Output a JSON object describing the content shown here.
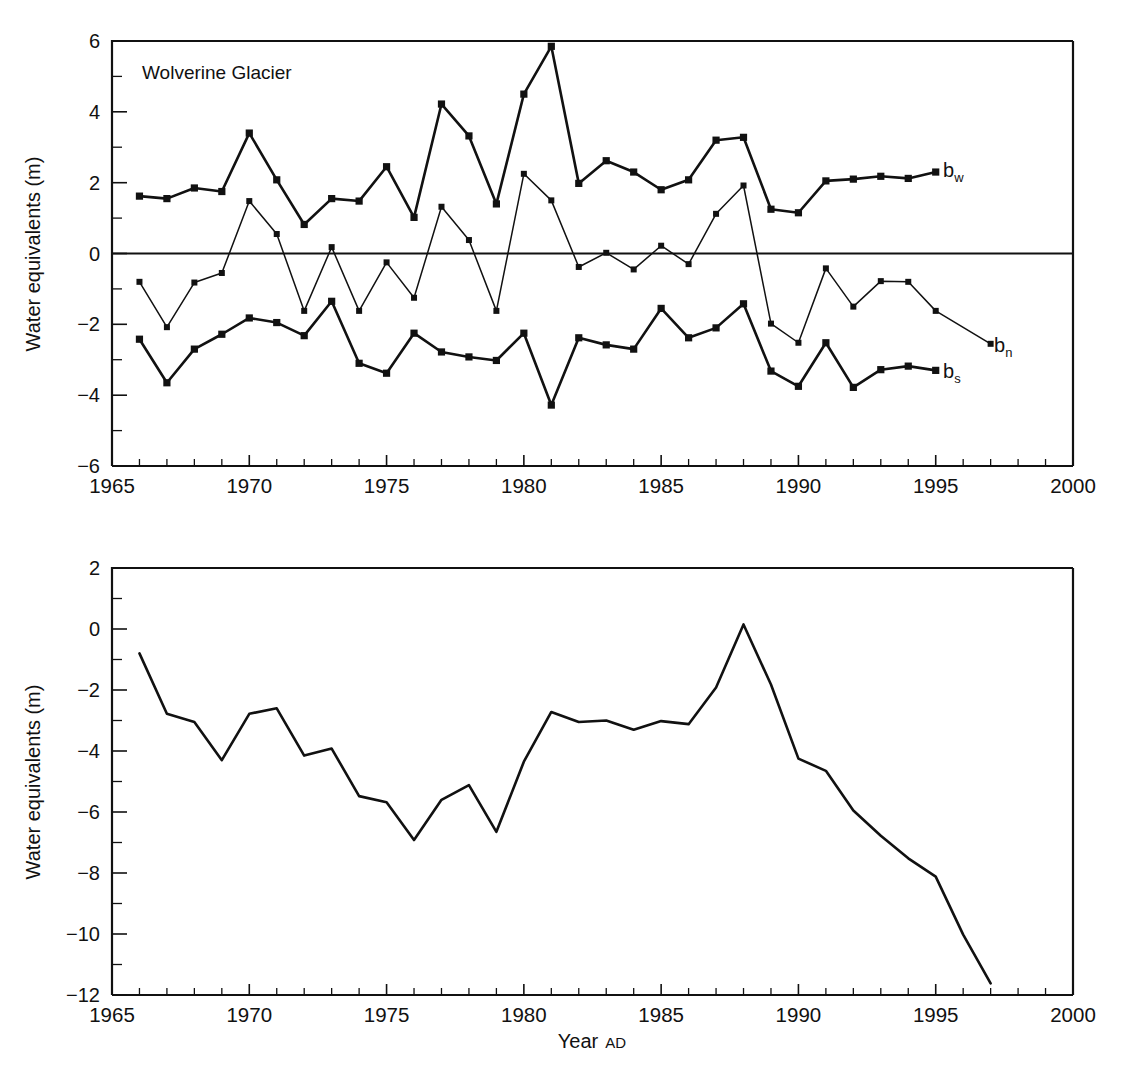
{
  "figure": {
    "panels": [
      {
        "name": "annual-balance-panel",
        "title": "Wolverine Glacier",
        "ylabel": "Water equivalents (m)",
        "xlabel": "",
        "series_labels": {
          "bw": "b",
          "bw_sub": "w",
          "bn": "b",
          "bn_sub": "n",
          "bs": "b",
          "bs_sub": "s"
        }
      },
      {
        "name": "cumulative-balance-panel",
        "title": "",
        "ylabel": "Water equivalents (m)",
        "xlabel": "Year",
        "xlabel_suffix": "AD"
      }
    ]
  },
  "chart_data": [
    {
      "type": "line",
      "name": "annual-mass-balance",
      "title": "Wolverine Glacier",
      "xlabel": "",
      "ylabel": "Water equivalents (m)",
      "xlim": [
        1965,
        2000
      ],
      "ylim": [
        -6,
        6
      ],
      "xticks": [
        1965,
        1970,
        1975,
        1980,
        1985,
        1990,
        1995,
        2000
      ],
      "xtick_labels": [
        "1965",
        "1970",
        "1975",
        "1980",
        "1985",
        "1990",
        "1995",
        "2000"
      ],
      "yticks": [
        -6,
        -4,
        -2,
        0,
        2,
        4,
        6
      ],
      "ytick_labels": [
        "−6",
        "−4",
        "−2",
        "0",
        "2",
        "4",
        "6"
      ],
      "minor_ytick_step": 1,
      "minor_xtick_step": 1,
      "grid": false,
      "zero_line": true,
      "legend": "inline-right",
      "markers": "square",
      "x": [
        1966,
        1967,
        1968,
        1969,
        1970,
        1971,
        1972,
        1973,
        1974,
        1975,
        1976,
        1977,
        1978,
        1979,
        1980,
        1981,
        1982,
        1983,
        1984,
        1985,
        1986,
        1987,
        1988,
        1989,
        1990,
        1991,
        1992,
        1993,
        1994,
        1995
      ],
      "series": [
        {
          "name": "b_w",
          "label": "bw",
          "description": "winter balance",
          "style": "thick",
          "values": [
            1.62,
            1.55,
            1.85,
            1.75,
            3.4,
            2.08,
            0.82,
            1.55,
            1.48,
            2.45,
            1.02,
            4.22,
            3.32,
            1.4,
            4.5,
            5.85,
            1.98,
            2.62,
            2.3,
            1.8,
            2.08,
            3.2,
            3.28,
            1.25,
            1.15,
            2.05,
            2.1,
            2.18,
            2.12,
            2.3
          ]
        },
        {
          "name": "b_n",
          "label": "bn",
          "description": "net balance",
          "style": "thin",
          "x_end": 1997,
          "values": [
            -0.8,
            -2.08,
            -0.82,
            -0.55,
            1.48,
            0.55,
            -1.62,
            0.18,
            -1.62,
            -0.25,
            -1.25,
            1.32,
            0.38,
            -1.62,
            2.25,
            1.5,
            -0.38,
            0.02,
            -0.45,
            0.22,
            -0.3,
            1.12,
            1.92,
            -1.98,
            -2.52,
            -0.42,
            -1.5,
            -0.78,
            -0.8,
            -1.62,
            -2.55
          ]
        },
        {
          "name": "b_s",
          "label": "bs",
          "description": "summer balance",
          "style": "thick",
          "values": [
            -2.42,
            -3.65,
            -2.7,
            -2.28,
            -1.82,
            -1.95,
            -2.32,
            -1.35,
            -3.1,
            -3.38,
            -2.25,
            -2.78,
            -2.92,
            -3.02,
            -2.25,
            -4.28,
            -2.38,
            -2.58,
            -2.7,
            -1.55,
            -2.38,
            -2.1,
            -1.42,
            -3.32,
            -3.75,
            -2.52,
            -3.78,
            -3.28,
            -3.18,
            -3.3
          ]
        }
      ]
    },
    {
      "type": "line",
      "name": "cumulative-mass-balance",
      "title": "",
      "xlabel": "Year AD",
      "ylabel": "Water equivalents (m)",
      "xlim": [
        1965,
        2000
      ],
      "ylim": [
        -12,
        2
      ],
      "xticks": [
        1965,
        1970,
        1975,
        1980,
        1985,
        1990,
        1995,
        2000
      ],
      "xtick_labels": [
        "1965",
        "1970",
        "1975",
        "1980",
        "1985",
        "1990",
        "1995",
        "2000"
      ],
      "yticks": [
        -12,
        -10,
        -8,
        -6,
        -4,
        -2,
        0,
        2
      ],
      "ytick_labels": [
        "−12",
        "−10",
        "−8",
        "−6",
        "−4",
        "−2",
        "0",
        "2"
      ],
      "minor_ytick_step": 1,
      "minor_xtick_step": 1,
      "grid": false,
      "markers": "none",
      "x": [
        1966,
        1967,
        1968,
        1969,
        1970,
        1971,
        1972,
        1973,
        1974,
        1975,
        1976,
        1977,
        1978,
        1979,
        1980,
        1981,
        1982,
        1983,
        1984,
        1985,
        1986,
        1987,
        1988,
        1989,
        1990,
        1991,
        1992,
        1993,
        1994,
        1995,
        1996,
        1997
      ],
      "series": [
        {
          "name": "cumulative",
          "label": "cumulative balance",
          "style": "cumulative",
          "values": [
            -0.8,
            -2.78,
            -3.05,
            -4.3,
            -2.78,
            -2.6,
            -4.15,
            -3.92,
            -5.48,
            -5.68,
            -6.92,
            -5.6,
            -5.12,
            -6.65,
            -4.35,
            -2.72,
            -3.05,
            -3.0,
            -3.3,
            -3.02,
            -3.12,
            -1.92,
            0.15,
            -1.82,
            -4.25,
            -4.65,
            -5.95,
            -6.78,
            -7.52,
            -8.12,
            -10.02,
            -11.62
          ]
        }
      ]
    }
  ]
}
